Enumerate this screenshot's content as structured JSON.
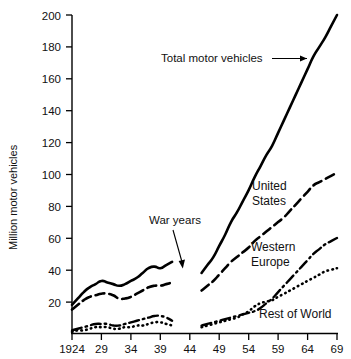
{
  "chart_data": {
    "type": "line",
    "title": "",
    "xlabel": "",
    "ylabel": "Million motor vehicles",
    "xlim": [
      1924,
      1969
    ],
    "ylim": [
      0,
      200
    ],
    "grid": false,
    "legend_position": "inline-annotations",
    "x_ticks": [
      "1924",
      "29",
      "34",
      "39",
      "44",
      "49",
      "54",
      "59",
      "64",
      "69"
    ],
    "x_tick_values": [
      1924,
      1929,
      1934,
      1939,
      1944,
      1949,
      1954,
      1959,
      1964,
      1969
    ],
    "y_ticks": [
      "20",
      "40",
      "60",
      "80",
      "100",
      "120",
      "140",
      "160",
      "180",
      "200"
    ],
    "y_tick_values": [
      20,
      40,
      60,
      80,
      100,
      120,
      140,
      160,
      180,
      200
    ],
    "data_gap": {
      "label": "War years",
      "from": 1941,
      "to": 1945
    },
    "series": [
      {
        "name": "Total motor vehicles",
        "style": "solid",
        "x": [
          1924,
          1925,
          1926,
          1927,
          1928,
          1929,
          1930,
          1931,
          1932,
          1933,
          1934,
          1935,
          1936,
          1937,
          1938,
          1939,
          1940,
          1941,
          1946,
          1947,
          1948,
          1949,
          1950,
          1951,
          1952,
          1953,
          1954,
          1955,
          1956,
          1957,
          1958,
          1959,
          1960,
          1961,
          1962,
          1963,
          1964,
          1965,
          1966,
          1967,
          1968,
          1969
        ],
        "values": [
          18,
          22,
          26,
          29,
          31,
          33,
          32,
          31,
          30,
          31,
          33,
          35,
          38,
          41,
          42,
          41,
          43,
          45,
          38,
          43,
          48,
          55,
          62,
          70,
          76,
          83,
          90,
          98,
          105,
          112,
          118,
          126,
          134,
          142,
          150,
          158,
          166,
          174,
          180,
          186,
          193,
          200
        ]
      },
      {
        "name": "United States",
        "style": "dashed",
        "x": [
          1924,
          1925,
          1926,
          1927,
          1928,
          1929,
          1930,
          1931,
          1932,
          1933,
          1934,
          1935,
          1936,
          1937,
          1938,
          1939,
          1940,
          1941,
          1946,
          1947,
          1948,
          1949,
          1950,
          1951,
          1952,
          1953,
          1954,
          1955,
          1956,
          1957,
          1958,
          1959,
          1960,
          1961,
          1962,
          1963,
          1964,
          1965,
          1966,
          1967,
          1968,
          1969
        ],
        "values": [
          15,
          18,
          21,
          23,
          24,
          25,
          25,
          24,
          22,
          22,
          23,
          25,
          27,
          29,
          30,
          30,
          31,
          32,
          27,
          30,
          33,
          37,
          41,
          45,
          48,
          51,
          54,
          58,
          61,
          64,
          67,
          70,
          73,
          77,
          81,
          85,
          89,
          93,
          95,
          97,
          99,
          101
        ]
      },
      {
        "name": "Western Europe",
        "style": "dash-dot",
        "x": [
          1924,
          1925,
          1926,
          1927,
          1928,
          1929,
          1930,
          1931,
          1932,
          1933,
          1934,
          1935,
          1936,
          1937,
          1938,
          1939,
          1940,
          1941,
          1946,
          1947,
          1948,
          1949,
          1950,
          1951,
          1952,
          1953,
          1954,
          1955,
          1956,
          1957,
          1958,
          1959,
          1960,
          1961,
          1962,
          1963,
          1964,
          1965,
          1966,
          1967,
          1968,
          1969
        ],
        "values": [
          2,
          3,
          4,
          5,
          6,
          6,
          6,
          5,
          5,
          6,
          7,
          8,
          9,
          10,
          11,
          11,
          10,
          8,
          5,
          6,
          7,
          8,
          9,
          10,
          11,
          12,
          13,
          14,
          16,
          19,
          22,
          26,
          30,
          34,
          38,
          42,
          46,
          50,
          53,
          56,
          58,
          60
        ]
      },
      {
        "name": "Rest of World",
        "style": "dotted",
        "x": [
          1924,
          1925,
          1926,
          1927,
          1928,
          1929,
          1930,
          1931,
          1932,
          1933,
          1934,
          1935,
          1936,
          1937,
          1938,
          1939,
          1940,
          1941,
          1946,
          1947,
          1948,
          1949,
          1950,
          1951,
          1952,
          1953,
          1954,
          1955,
          1956,
          1957,
          1958,
          1959,
          1960,
          1961,
          1962,
          1963,
          1964,
          1965,
          1966,
          1967,
          1968,
          1969
        ],
        "values": [
          1,
          2,
          2,
          3,
          4,
          4,
          4,
          3,
          3,
          4,
          4,
          5,
          5,
          6,
          7,
          7,
          6,
          5,
          4,
          5,
          6,
          7,
          8,
          9,
          10,
          12,
          14,
          17,
          19,
          20,
          21,
          23,
          25,
          27,
          29,
          31,
          33,
          35,
          37,
          39,
          40,
          41
        ]
      }
    ],
    "annotations": [
      {
        "text": "Total motor vehicles",
        "kind": "arrow-label"
      },
      {
        "text": "War years",
        "kind": "arrow-label"
      },
      {
        "text": "United",
        "kind": "series-label"
      },
      {
        "text": "States",
        "kind": "series-label"
      },
      {
        "text": "Western",
        "kind": "series-label"
      },
      {
        "text": "Europe",
        "kind": "series-label"
      },
      {
        "text": "Rest of World",
        "kind": "series-label"
      }
    ]
  },
  "colors": {
    "ink": "#000000",
    "background": "#ffffff"
  }
}
